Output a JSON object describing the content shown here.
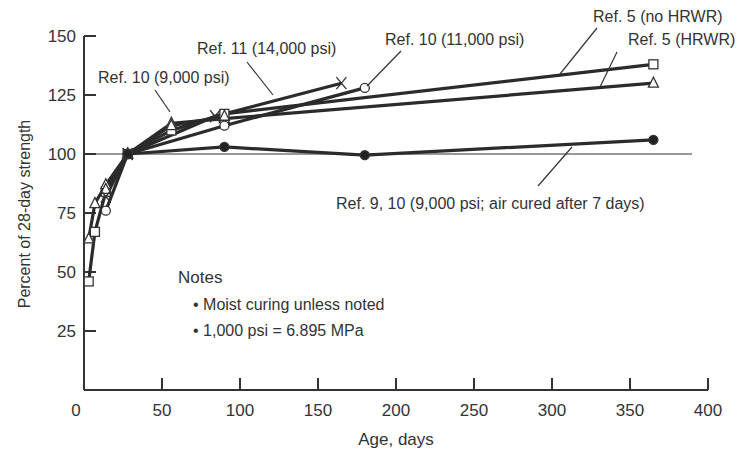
{
  "chart_data": {
    "type": "line",
    "title": "",
    "xlabel": "Age, days",
    "ylabel": "Percent of 28-day strength",
    "xlim": [
      0,
      400
    ],
    "ylim": [
      0,
      150
    ],
    "xticks": [
      0,
      50,
      100,
      150,
      200,
      250,
      300,
      350,
      400
    ],
    "yticks": [
      25,
      50,
      75,
      100,
      125,
      150
    ],
    "reference_line": 100,
    "grid": false,
    "series": [
      {
        "name": "Ref. 5 (no HRWR)",
        "marker": "square",
        "x": [
          3,
          7,
          14,
          28,
          56,
          90,
          365
        ],
        "y": [
          46,
          67,
          84,
          100,
          110,
          117,
          138
        ]
      },
      {
        "name": "Ref. 5 (HRWR)",
        "marker": "triangle",
        "x": [
          3,
          7,
          14,
          28,
          56,
          90,
          365
        ],
        "y": [
          64,
          79,
          87,
          100,
          113,
          115,
          130
        ]
      },
      {
        "name": "Ref. 10 (9,000 psi)",
        "marker": "triangle",
        "x": [
          14,
          28,
          56,
          90
        ],
        "y": [
          85,
          100,
          112,
          116
        ]
      },
      {
        "name": "Ref. 10 (11,000 psi)",
        "marker": "circle-open",
        "x": [
          14,
          28,
          90,
          180
        ],
        "y": [
          76,
          100,
          112,
          128
        ]
      },
      {
        "name": "Ref. 11 (14,000 psi)",
        "marker": "x",
        "x": [
          14,
          28,
          84,
          165
        ],
        "y": [
          82,
          100,
          116,
          130
        ]
      },
      {
        "name": "Ref. 9, 10 (9,000 psi; air cured after 7 days)",
        "marker": "circle-filled",
        "x": [
          28,
          90,
          180,
          365
        ],
        "y": [
          100,
          103,
          99.5,
          106
        ]
      }
    ],
    "annotations": [
      "Ref. 5 (no HRWR)",
      "Ref. 5 (HRWR)",
      "Ref. 10 (11,000 psi)",
      "Ref. 11 (14,000 psi)",
      "Ref. 10 (9,000 psi)",
      "Ref. 9, 10 (9,000 psi; air cured after 7 days)"
    ],
    "notes": {
      "title": "Notes",
      "items": [
        "Moist curing unless noted",
        "1,000 psi = 6.895 MPa"
      ]
    }
  },
  "labels": {
    "ref5_no_hrwr": "Ref. 5 (no HRWR)",
    "ref5_hrwr": "Ref. 5 (HRWR)",
    "ref10_11000": "Ref. 10 (11,000 psi)",
    "ref11_14000": "Ref. 11 (14,000 psi)",
    "ref10_9000": "Ref. 10 (9,000 psi)",
    "ref9_10_air": "Ref. 9, 10 (9,000 psi; air cured after 7 days)",
    "notes_title": "Notes",
    "note1": "• Moist curing unless noted",
    "note2": "• 1,000 psi = 6.895 MPa",
    "xlabel": "Age, days",
    "ylabel": "Percent of 28-day strength"
  }
}
